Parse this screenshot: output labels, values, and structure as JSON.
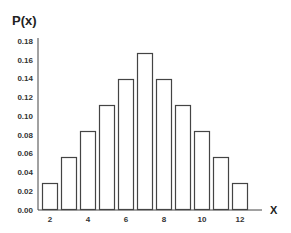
{
  "chart_data": {
    "type": "bar",
    "title": "",
    "xlabel": "X",
    "ylabel": "P(x)",
    "categories": [
      2,
      3,
      4,
      5,
      6,
      7,
      8,
      9,
      10,
      11,
      12
    ],
    "values": [
      0.0278,
      0.0556,
      0.0833,
      0.1111,
      0.1389,
      0.1667,
      0.1389,
      0.1111,
      0.0833,
      0.0556,
      0.0278
    ],
    "ylim": [
      0,
      0.18
    ],
    "yticks": [
      "0.00",
      "0.02",
      "0.04",
      "0.06",
      "0.08",
      "0.10",
      "0.12",
      "0.14",
      "0.16",
      "0.18"
    ],
    "xticks": [
      "2",
      "4",
      "6",
      "8",
      "10",
      "12"
    ],
    "grid": false,
    "legend": null,
    "colors": {
      "bar_fill": "#ffffff",
      "bar_stroke": "#444444",
      "axis": "#444444"
    }
  }
}
